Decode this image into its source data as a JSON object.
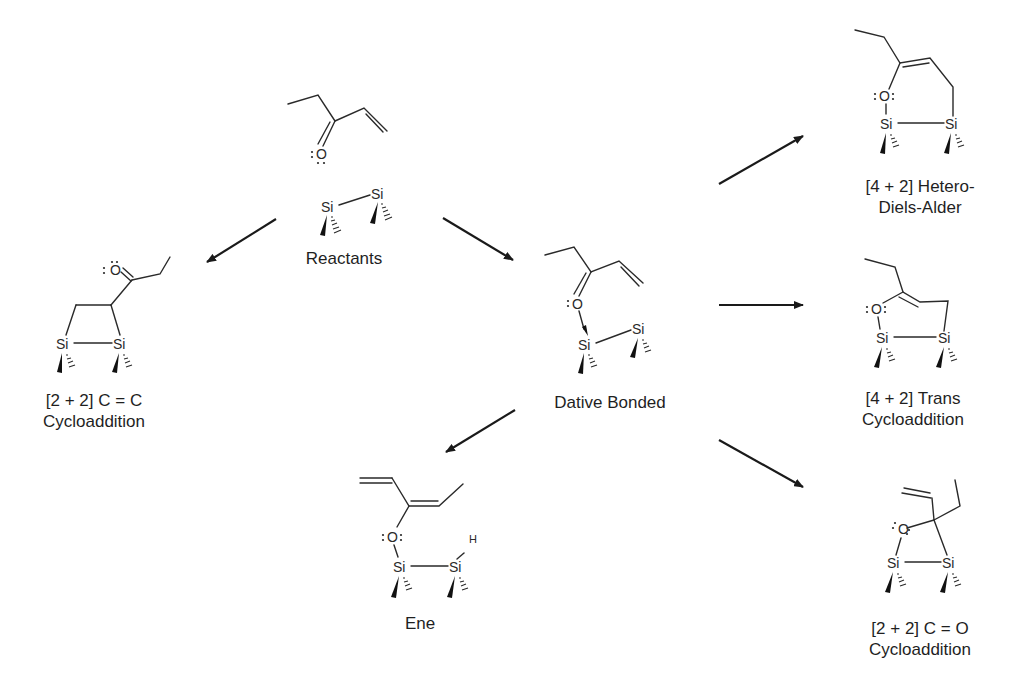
{
  "diagram": {
    "type": "reaction-scheme",
    "center_species": "Dative Bonded",
    "nodes": [
      {
        "id": "reactants",
        "label": "Reactants"
      },
      {
        "id": "cc_cycloaddition",
        "label_line1": "[2 + 2] C = C",
        "label_line2": "Cycloaddition"
      },
      {
        "id": "dative",
        "label": "Dative Bonded"
      },
      {
        "id": "hda",
        "label_line1": "[4 + 2] Hetero-",
        "label_line2": "Diels-Alder"
      },
      {
        "id": "trans",
        "label_line1": "[4 + 2] Trans",
        "label_line2": "Cycloaddition"
      },
      {
        "id": "ene",
        "label": "Ene"
      },
      {
        "id": "co_cycloaddition",
        "label_line1": "[2 + 2] C = O",
        "label_line2": "Cycloaddition"
      }
    ],
    "edges": [
      {
        "from": "reactants",
        "to": "cc_cycloaddition"
      },
      {
        "from": "reactants",
        "to": "dative"
      },
      {
        "from": "dative",
        "to": "ene"
      },
      {
        "from": "dative",
        "to": "hda"
      },
      {
        "from": "dative",
        "to": "trans"
      },
      {
        "from": "dative",
        "to": "co_cycloaddition"
      }
    ],
    "atoms": {
      "si": "Si",
      "o": "O",
      "h": "H"
    }
  }
}
